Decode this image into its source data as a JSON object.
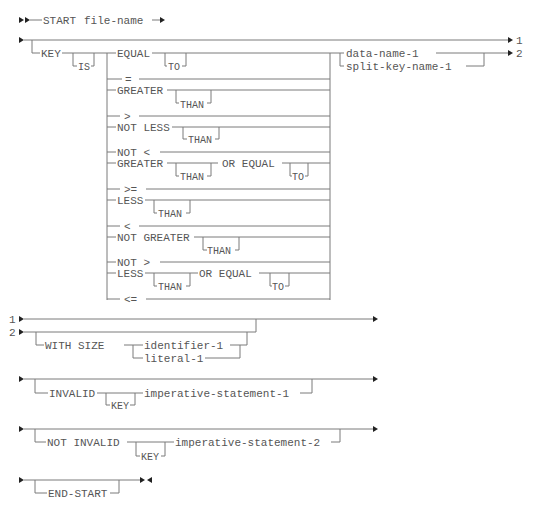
{
  "diagram": {
    "start_line": {
      "verb": "START",
      "operand": "file-name"
    },
    "key_clause": {
      "key": "KEY",
      "is": "IS",
      "operators": [
        {
          "word": "EQUAL",
          "optional": "TO"
        },
        {
          "word": "="
        },
        {
          "word": "GREATER",
          "optional": "THAN"
        },
        {
          "word": ">"
        },
        {
          "word": "NOT LESS",
          "optional": "THAN"
        },
        {
          "word": "NOT <"
        },
        {
          "word": "GREATER",
          "optional": "THAN",
          "suffix": "OR EQUAL",
          "suffix_optional": "TO"
        },
        {
          "word": ">="
        },
        {
          "word": "LESS",
          "optional": "THAN"
        },
        {
          "word": "<"
        },
        {
          "word": "NOT GREATER",
          "optional": "THAN"
        },
        {
          "word": "NOT >"
        },
        {
          "word": "LESS",
          "optional": "THAN",
          "suffix": "OR EQUAL",
          "suffix_optional": "TO"
        },
        {
          "word": "<="
        }
      ],
      "operands": [
        "data-name-1",
        "split-key-name-1"
      ],
      "continuations": [
        "1",
        "2"
      ]
    },
    "size_clause": {
      "continuations": [
        "1",
        "2"
      ],
      "with_size": "WITH SIZE",
      "operands": [
        "identifier-1",
        "literal-1"
      ]
    },
    "invalid_clause": {
      "invalid": "INVALID",
      "key": "KEY",
      "statement": "imperative-statement-1"
    },
    "not_invalid_clause": {
      "not_invalid": "NOT INVALID",
      "key": "KEY",
      "statement": "imperative-statement-2"
    },
    "end_clause": {
      "end": "END-START"
    }
  }
}
